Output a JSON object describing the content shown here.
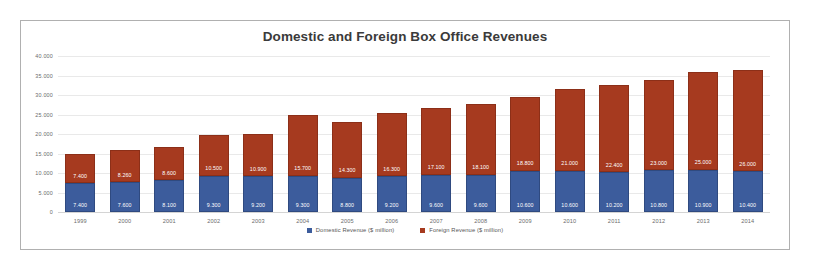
{
  "chart_data": {
    "type": "bar",
    "stacked": true,
    "title": "Domestic and Foreign Box Office Revenues",
    "xlabel": "",
    "ylabel": "",
    "ylim": [
      0,
      40000
    ],
    "ytick_values": [
      40000,
      35000,
      30000,
      25000,
      20000,
      15000,
      10000,
      5000,
      0
    ],
    "ytick_labels": [
      "40.000",
      "35.000",
      "30.000",
      "25.000",
      "20.000",
      "15.000",
      "10.000",
      "5.000",
      "0"
    ],
    "grid": true,
    "legend_position": "bottom",
    "categories": [
      "1999",
      "2000",
      "2001",
      "2002",
      "2003",
      "2004",
      "2005",
      "2006",
      "2007",
      "2008",
      "2009",
      "2010",
      "2011",
      "2012",
      "2013",
      "2014"
    ],
    "series": [
      {
        "name": "Domestic Revenue ($ million)",
        "color": "#3c5c9c",
        "values": [
          7400,
          7600,
          8100,
          9300,
          9200,
          9300,
          8800,
          9200,
          9600,
          9600,
          10600,
          10600,
          10200,
          10800,
          10900,
          10400
        ],
        "labels": [
          "7.400",
          "7.600",
          "8.100",
          "9.300",
          "9.200",
          "9.300",
          "8.800",
          "9.200",
          "9.600",
          "9.600",
          "10.600",
          "10.600",
          "10.200",
          "10.800",
          "10.900",
          "10.400"
        ]
      },
      {
        "name": "Foreign Revenue ($ million)",
        "color": "#a63a1f",
        "values": [
          7400,
          8260,
          8600,
          10500,
          10900,
          15700,
          14300,
          16300,
          17100,
          18100,
          18800,
          21000,
          22400,
          23000,
          25000,
          26000
        ],
        "labels": [
          "7.400",
          "8.260",
          "8.600",
          "10.500",
          "10.900",
          "15.700",
          "14.300",
          "16.300",
          "17.100",
          "18.100",
          "18.800",
          "21.000",
          "22.400",
          "23.000",
          "25.000",
          "26.000"
        ]
      }
    ]
  }
}
